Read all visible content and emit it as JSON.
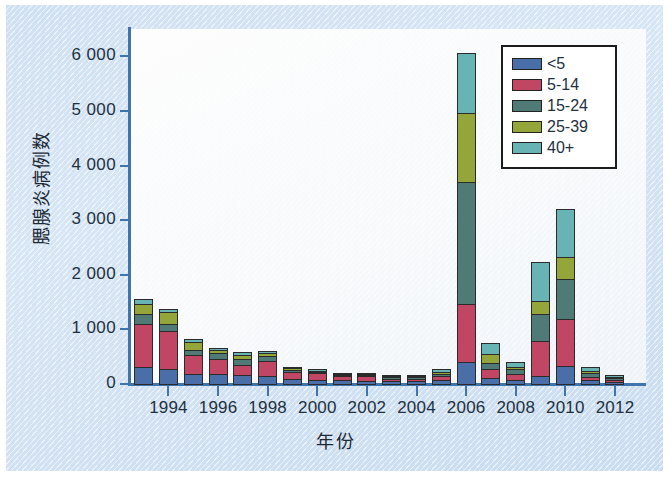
{
  "chart_data": {
    "type": "bar",
    "subtype": "stacked-vertical",
    "title": "",
    "xlabel": "年份",
    "ylabel": "腮腺炎病例数",
    "ylim": [
      0,
      6500
    ],
    "ytick_values": [
      0,
      1000,
      2000,
      3000,
      4000,
      5000,
      6000
    ],
    "ytick_labels": [
      "0",
      "1 000",
      "2 000",
      "3 000",
      "4 000",
      "5 000",
      "6 000"
    ],
    "grid": false,
    "legend_position": "top-right",
    "categories": [
      "1993",
      "1994",
      "1995",
      "1996",
      "1997",
      "1998",
      "1999",
      "2000",
      "2001",
      "2002",
      "2003",
      "2004",
      "2005",
      "2006",
      "2007",
      "2008",
      "2009",
      "2010",
      "2011",
      "2012"
    ],
    "xtick_labels": [
      "1994",
      "1996",
      "1998",
      "2000",
      "2002",
      "2004",
      "2006",
      "2008",
      "2010",
      "2012"
    ],
    "xtick_categories": [
      "1994",
      "1996",
      "1998",
      "2000",
      "2002",
      "2004",
      "2006",
      "2008",
      "2010",
      "2012"
    ],
    "series": [
      {
        "name": "<5",
        "color": "#4a6fa8",
        "values": [
          330,
          290,
          200,
          195,
          175,
          160,
          105,
          95,
          85,
          75,
          65,
          65,
          95,
          420,
          130,
          95,
          165,
          350,
          85,
          55
        ]
      },
      {
        "name": "5-14",
        "color": "#c04664",
        "values": [
          800,
          720,
          365,
          300,
          210,
          300,
          155,
          135,
          95,
          100,
          65,
          70,
          95,
          1080,
          180,
          120,
          660,
          870,
          75,
          55
        ]
      },
      {
        "name": "15-24",
        "color": "#4f7a75",
        "values": [
          205,
          145,
          115,
          120,
          130,
          110,
          55,
          50,
          45,
          40,
          45,
          40,
          55,
          2250,
          130,
          110,
          510,
          755,
          100,
          55
        ]
      },
      {
        "name": "25-39",
        "color": "#94a63a",
        "values": [
          210,
          230,
          155,
          90,
          95,
          80,
          50,
          40,
          35,
          30,
          30,
          30,
          55,
          1290,
          185,
          65,
          260,
          430,
          55,
          40
        ]
      },
      {
        "name": "40+",
        "color": "#68b3b4",
        "values": [
          95,
          85,
          75,
          55,
          60,
          45,
          40,
          40,
          35,
          30,
          25,
          30,
          75,
          1105,
          225,
          105,
          730,
          900,
          80,
          45
        ]
      }
    ],
    "totals": [
      1640,
      1470,
      910,
      760,
      670,
      695,
      405,
      360,
      295,
      275,
      230,
      235,
      375,
      6145,
      850,
      495,
      2325,
      3305,
      395,
      250
    ]
  },
  "axis": {
    "y_title": "腮腺炎病例数",
    "x_title": "年份"
  },
  "legend": {
    "items": [
      {
        "label": "<5",
        "color": "#4a6fa8"
      },
      {
        "label": "5-14",
        "color": "#c04664"
      },
      {
        "label": "15-24",
        "color": "#4f7a75"
      },
      {
        "label": "25-39",
        "color": "#94a63a"
      },
      {
        "label": "40+",
        "color": "#68b3b4"
      }
    ]
  },
  "theme": {
    "page_background": "#ffffff",
    "panel_background": "#d3e3f4",
    "plot_background": "#f8fafc",
    "axis_color": "#3f74ad",
    "text_color": "#23313f"
  }
}
